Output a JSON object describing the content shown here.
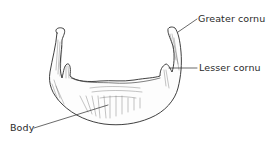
{
  "figure": {
    "labels": {
      "greater_cornu": "Greater cornu",
      "lesser_cornu": "Lesser cornu",
      "body": "Body"
    },
    "colors": {
      "ink": "#2a2a2a",
      "background": "#ffffff"
    }
  }
}
